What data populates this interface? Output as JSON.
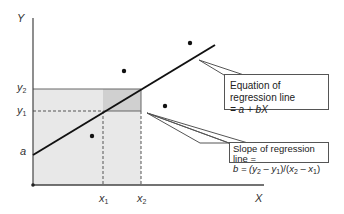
{
  "diagram": {
    "axis_labels": {
      "y": "Y",
      "x": "X"
    },
    "tick_labels": {
      "y2": {
        "base": "y",
        "sub": "2"
      },
      "y1": {
        "base": "y",
        "sub": "1"
      },
      "a": "a",
      "x1": {
        "base": "x",
        "sub": "1"
      },
      "x2": {
        "base": "x",
        "sub": "2"
      }
    },
    "callouts": {
      "equation": {
        "line1": "Equation of regression line",
        "line2": "= a + bX"
      },
      "slope": {
        "line1": "Slope of regression line =",
        "line2_prefix": "b = (",
        "y2": "y",
        "y2_sub": "2",
        "minus1": " – ",
        "y1": "y",
        "y1_sub": "1",
        "mid": ")/(",
        "x2": "x",
        "x2_sub": "2",
        "minus2": " – ",
        "x1": "x",
        "x1_sub": "1",
        "close": ")"
      }
    },
    "colors": {
      "shade_light": "#e6e6e6",
      "shade_dark": "#cfcfcf",
      "line": "#111111",
      "axis": "#444444"
    },
    "points": [
      [
        124,
        71
      ],
      [
        190,
        43
      ],
      [
        165,
        106
      ],
      [
        92,
        136
      ]
    ]
  }
}
